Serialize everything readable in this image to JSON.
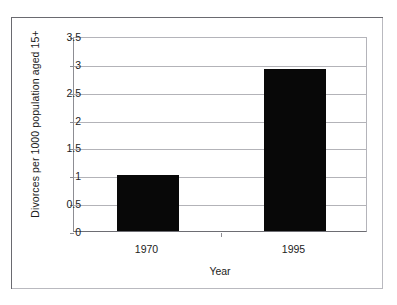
{
  "chart_data": {
    "type": "bar",
    "title": "",
    "xlabel": "Year",
    "ylabel": "Divorces per 1000 population aged 15+",
    "categories": [
      "1970",
      "1995"
    ],
    "values": [
      1.0,
      2.9
    ],
    "ylim": [
      0,
      3.5
    ],
    "yticks": [
      "0",
      "0.5",
      "1",
      "1.5",
      "2",
      "2.5",
      "3",
      "3.5"
    ],
    "ytick_values": [
      0,
      0.5,
      1,
      1.5,
      2,
      2.5,
      3,
      3.5
    ],
    "grid": "horizontal",
    "legend": "none",
    "bar_color": "#080808",
    "gridline_color": "#b3b3b8",
    "background_color": "#ffffff",
    "frame_color": "#6a6a70"
  },
  "axes": {
    "y_title": "Divorces per 1000 population aged 15+",
    "x_title": "Year"
  }
}
